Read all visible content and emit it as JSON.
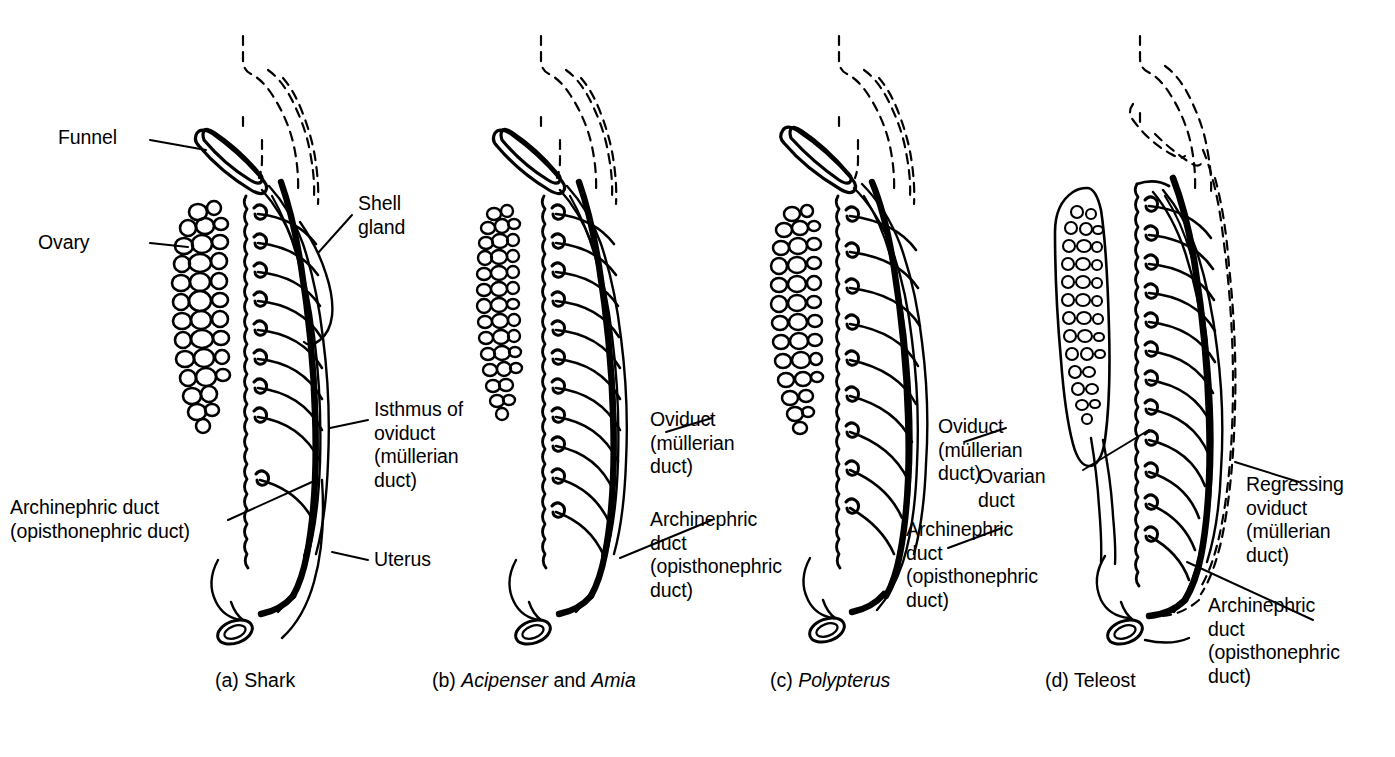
{
  "figure": {
    "background_color": "#ffffff",
    "ink_color": "#000000",
    "panel_count": 4
  },
  "panels": [
    {
      "id": "a",
      "caption": "(a) Shark",
      "caption_species_italic": "",
      "labels": [
        {
          "key": "funnel",
          "text": "Funnel"
        },
        {
          "key": "ovary",
          "text": "Ovary"
        },
        {
          "key": "shell_gland",
          "text": "Shell\ngland"
        },
        {
          "key": "isthmus",
          "text": "Isthmus of\noviduct\n(müllerian\nduct)"
        },
        {
          "key": "uterus",
          "text": "Uterus"
        },
        {
          "key": "archinephric",
          "text": "Archinephric duct\n(opisthonephric duct)"
        }
      ]
    },
    {
      "id": "b",
      "caption": "(b) Acipenser and Amia",
      "caption_parts": [
        {
          "text": "(b) ",
          "italic": false
        },
        {
          "text": "Acipenser",
          "italic": true
        },
        {
          "text": " and ",
          "italic": false
        },
        {
          "text": "Amia",
          "italic": true
        }
      ],
      "labels": [
        {
          "key": "oviduct",
          "text": "Oviduct\n(müllerian\nduct)"
        },
        {
          "key": "archinephric",
          "text": "Archinephric\nduct\n(opisthonephric\nduct)"
        }
      ]
    },
    {
      "id": "c",
      "caption": "(c) Polypterus",
      "caption_parts": [
        {
          "text": "(c) ",
          "italic": false
        },
        {
          "text": "Polypterus",
          "italic": true
        }
      ],
      "labels": [
        {
          "key": "oviduct",
          "text": "Oviduct\n(müllerian\nduct)"
        },
        {
          "key": "archinephric",
          "text": "Archinephric\nduct\n(opisthonephric\nduct)"
        }
      ]
    },
    {
      "id": "d",
      "caption": "(d) Teleost",
      "caption_parts": [
        {
          "text": "(d) Teleost",
          "italic": false
        }
      ],
      "labels": [
        {
          "key": "ovarian_duct",
          "text": "Ovarian\nduct"
        },
        {
          "key": "regressing_oviduct",
          "text": "Regressing\noviduct\n(müllerian\nduct)"
        },
        {
          "key": "archinephric",
          "text": "Archinephric\nduct\n(opisthonephric\nduct)"
        }
      ]
    }
  ]
}
